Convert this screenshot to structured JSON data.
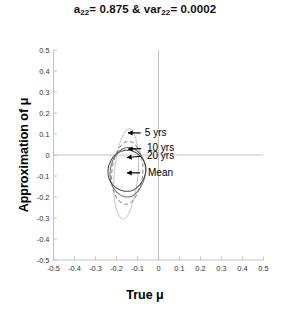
{
  "chart_data": {
    "type": "line",
    "title_parts": {
      "a_sym": "a",
      "a_sub": "22",
      "a_val": "= 0.875 &",
      "var_sym": "var",
      "var_sub": "22",
      "var_val": "= 0.0002"
    },
    "xlabel": "True μ",
    "ylabel": "Approximation of μ",
    "xlim": [
      -0.5,
      0.5
    ],
    "ylim": [
      -0.5,
      0.5
    ],
    "grid": false,
    "legend_position": "inline-annotations",
    "xticks": [
      "-0.5",
      "-0.4",
      "-0.3",
      "-0.2",
      "-0.1",
      "0",
      "0.1",
      "0.2",
      "0.3",
      "0.4",
      "0.5"
    ],
    "xtick_values": [
      -0.5,
      -0.4,
      -0.3,
      -0.2,
      -0.1,
      0,
      0.1,
      0.2,
      0.3,
      0.4,
      0.5
    ],
    "yticks": [
      "0.5",
      "0.4",
      "0.3",
      "0.2",
      "0.1",
      "0",
      "-0.1",
      "-0.2",
      "-0.3",
      "-0.4",
      "-0.5"
    ],
    "ytick_values": [
      0.5,
      0.4,
      0.3,
      0.2,
      0.1,
      0,
      -0.1,
      -0.2,
      -0.3,
      -0.4,
      -0.5
    ],
    "series": [
      {
        "name": "5 yrs",
        "style": "solid",
        "color": "#c9c9c9",
        "shape": "closed-ellipse",
        "center": [
          -0.155,
          -0.09
        ],
        "semi_x": 0.055,
        "semi_y": 0.215,
        "tilt_deg": -4
      },
      {
        "name": "10 yrs",
        "style": "dashed",
        "color": "#8f8f8f",
        "shape": "closed-ellipse",
        "center": [
          -0.15,
          -0.085
        ],
        "semi_x": 0.072,
        "semi_y": 0.15,
        "tilt_deg": -3
      },
      {
        "name": "20 yrs",
        "style": "solid",
        "color": "#6e6e6e",
        "shape": "closed-ellipse",
        "center": [
          -0.148,
          -0.082
        ],
        "semi_x": 0.082,
        "semi_y": 0.118,
        "tilt_deg": -2
      },
      {
        "name": "Mean",
        "style": "solid",
        "color": "#4a4a4a",
        "shape": "closed-ellipse",
        "center": [
          -0.152,
          -0.075
        ],
        "semi_x": 0.088,
        "semi_y": 0.098,
        "tilt_deg": 0
      }
    ],
    "annotations": [
      {
        "label": "5 yrs",
        "text_xy": [
          -0.065,
          0.105
        ],
        "arrow_from": [
          -0.085,
          0.105
        ],
        "arrow_to": [
          -0.145,
          0.105
        ]
      },
      {
        "label": "10 yrs",
        "text_xy": [
          -0.055,
          0.033
        ],
        "arrow_from": [
          -0.082,
          0.03
        ],
        "arrow_to": [
          -0.145,
          0.028
        ]
      },
      {
        "label": "20 yrs",
        "text_xy": [
          -0.055,
          -0.003
        ],
        "arrow_from": [
          -0.082,
          -0.006
        ],
        "arrow_to": [
          -0.15,
          -0.012
        ]
      },
      {
        "label": "Mean",
        "text_xy": [
          -0.05,
          -0.082
        ],
        "arrow_from": [
          -0.088,
          -0.085
        ],
        "arrow_to": [
          -0.15,
          -0.085
        ]
      }
    ],
    "axis_lines": {
      "x_zero": true,
      "y_zero": true,
      "color": "#bdbdbd"
    }
  }
}
